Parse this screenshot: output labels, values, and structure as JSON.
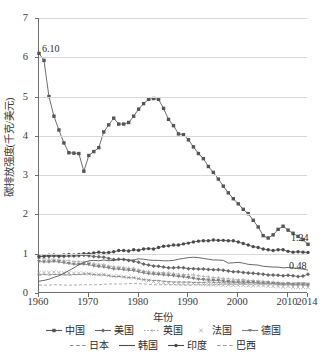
{
  "chart_data": {
    "type": "line",
    "title": "",
    "xlabel": "年份",
    "ylabel": "碳排放强度(千克/美元)",
    "xlim": [
      1960,
      2014
    ],
    "ylim": [
      0,
      7
    ],
    "yticks": [
      0,
      1,
      2,
      3,
      4,
      5,
      6,
      7
    ],
    "xticks": [
      1960,
      1970,
      1980,
      1990,
      2000,
      2010,
      2014
    ],
    "grid": true,
    "legend_position": "bottom",
    "annotations": [
      {
        "text": "6.10",
        "x": 1960,
        "y": 6.1
      },
      {
        "text": "1.24",
        "x": 2014,
        "y": 1.24
      },
      {
        "text": "0.48",
        "x": 2014,
        "y": 0.48
      }
    ],
    "x": [
      1960,
      1961,
      1962,
      1963,
      1964,
      1965,
      1966,
      1967,
      1968,
      1969,
      1970,
      1971,
      1972,
      1973,
      1974,
      1975,
      1976,
      1977,
      1978,
      1979,
      1980,
      1981,
      1982,
      1983,
      1984,
      1985,
      1986,
      1987,
      1988,
      1989,
      1990,
      1991,
      1992,
      1993,
      1994,
      1995,
      1996,
      1997,
      1998,
      1999,
      2000,
      2001,
      2002,
      2003,
      2004,
      2005,
      2006,
      2007,
      2008,
      2009,
      2010,
      2011,
      2012,
      2013,
      2014
    ],
    "series": [
      {
        "name": "中国",
        "marker": "square",
        "linestyle": "solid",
        "color": "#555555",
        "values": [
          6.1,
          5.92,
          5.0,
          4.5,
          4.15,
          3.82,
          3.57,
          3.56,
          3.55,
          3.1,
          3.5,
          3.6,
          3.7,
          4.1,
          4.28,
          4.45,
          4.3,
          4.3,
          4.34,
          4.5,
          4.68,
          4.82,
          4.93,
          4.95,
          4.93,
          4.7,
          4.42,
          4.26,
          4.05,
          4.03,
          3.9,
          3.72,
          3.55,
          3.42,
          3.22,
          3.07,
          2.9,
          2.72,
          2.55,
          2.4,
          2.27,
          2.13,
          2.02,
          1.85,
          1.68,
          1.46,
          1.4,
          1.48,
          1.62,
          1.7,
          1.6,
          1.52,
          1.44,
          1.36,
          1.24
        ]
      },
      {
        "name": "美国",
        "marker": "diamond",
        "linestyle": "solid",
        "color": "#666666",
        "values": [
          0.94,
          0.93,
          0.93,
          0.94,
          0.93,
          0.93,
          0.94,
          0.94,
          0.95,
          0.96,
          0.95,
          0.93,
          0.92,
          0.91,
          0.88,
          0.85,
          0.86,
          0.85,
          0.83,
          0.81,
          0.78,
          0.74,
          0.71,
          0.69,
          0.68,
          0.66,
          0.64,
          0.64,
          0.65,
          0.64,
          0.62,
          0.62,
          0.61,
          0.61,
          0.6,
          0.59,
          0.59,
          0.58,
          0.56,
          0.54,
          0.54,
          0.52,
          0.51,
          0.5,
          0.49,
          0.48,
          0.46,
          0.46,
          0.45,
          0.44,
          0.45,
          0.44,
          0.42,
          0.43,
          0.48
        ]
      },
      {
        "name": "英国",
        "marker": "cross-small",
        "linestyle": "dotted",
        "color": "#a8a8a8",
        "values": [
          0.88,
          0.87,
          0.86,
          0.86,
          0.84,
          0.83,
          0.82,
          0.8,
          0.8,
          0.79,
          0.78,
          0.75,
          0.73,
          0.72,
          0.69,
          0.67,
          0.66,
          0.65,
          0.63,
          0.63,
          0.59,
          0.56,
          0.55,
          0.53,
          0.52,
          0.52,
          0.51,
          0.5,
          0.48,
          0.47,
          0.46,
          0.46,
          0.44,
          0.42,
          0.41,
          0.39,
          0.39,
          0.37,
          0.36,
          0.35,
          0.34,
          0.34,
          0.32,
          0.32,
          0.31,
          0.3,
          0.29,
          0.28,
          0.27,
          0.25,
          0.25,
          0.23,
          0.23,
          0.22,
          0.21
        ]
      },
      {
        "name": "法国",
        "marker": "x",
        "linestyle": "none",
        "color": "#9a9a9a",
        "values": [
          0.52,
          0.52,
          0.52,
          0.53,
          0.52,
          0.51,
          0.51,
          0.5,
          0.5,
          0.5,
          0.49,
          0.48,
          0.47,
          0.47,
          0.45,
          0.43,
          0.43,
          0.41,
          0.4,
          0.39,
          0.37,
          0.34,
          0.32,
          0.29,
          0.27,
          0.26,
          0.25,
          0.24,
          0.23,
          0.23,
          0.23,
          0.24,
          0.23,
          0.22,
          0.21,
          0.21,
          0.21,
          0.2,
          0.21,
          0.2,
          0.2,
          0.2,
          0.19,
          0.19,
          0.19,
          0.19,
          0.18,
          0.17,
          0.17,
          0.16,
          0.17,
          0.15,
          0.15,
          0.15,
          0.14
        ]
      },
      {
        "name": "德国",
        "marker": "triangle-down",
        "linestyle": "solid",
        "color": "#808080",
        "values": [
          0.8,
          0.79,
          0.79,
          0.8,
          0.79,
          0.77,
          0.75,
          0.73,
          0.73,
          0.73,
          0.72,
          0.69,
          0.67,
          0.66,
          0.64,
          0.61,
          0.61,
          0.59,
          0.58,
          0.57,
          0.54,
          0.51,
          0.49,
          0.48,
          0.47,
          0.46,
          0.45,
          0.44,
          0.42,
          0.41,
          0.39,
          0.37,
          0.35,
          0.34,
          0.33,
          0.32,
          0.32,
          0.3,
          0.29,
          0.28,
          0.28,
          0.28,
          0.27,
          0.27,
          0.26,
          0.25,
          0.25,
          0.24,
          0.23,
          0.22,
          0.23,
          0.21,
          0.21,
          0.21,
          0.2
        ]
      },
      {
        "name": "日本",
        "marker": "dash",
        "linestyle": "dashed",
        "color": "#8d8d8d",
        "values": [
          0.46,
          0.47,
          0.46,
          0.47,
          0.47,
          0.46,
          0.46,
          0.47,
          0.47,
          0.48,
          0.49,
          0.47,
          0.46,
          0.46,
          0.44,
          0.42,
          0.42,
          0.41,
          0.39,
          0.39,
          0.36,
          0.34,
          0.33,
          0.32,
          0.32,
          0.3,
          0.29,
          0.28,
          0.28,
          0.28,
          0.28,
          0.27,
          0.27,
          0.27,
          0.28,
          0.27,
          0.27,
          0.26,
          0.26,
          0.26,
          0.26,
          0.25,
          0.26,
          0.26,
          0.25,
          0.25,
          0.24,
          0.25,
          0.24,
          0.23,
          0.24,
          0.25,
          0.26,
          0.26,
          0.25
        ]
      },
      {
        "name": "韩国",
        "marker": "none",
        "linestyle": "solid",
        "color": "#4d4d4d",
        "values": [
          0.3,
          0.32,
          0.35,
          0.4,
          0.44,
          0.5,
          0.57,
          0.64,
          0.72,
          0.78,
          0.82,
          0.83,
          0.82,
          0.84,
          0.82,
          0.83,
          0.85,
          0.86,
          0.84,
          0.84,
          0.87,
          0.86,
          0.84,
          0.83,
          0.83,
          0.82,
          0.82,
          0.83,
          0.86,
          0.88,
          0.9,
          0.91,
          0.9,
          0.88,
          0.86,
          0.84,
          0.84,
          0.83,
          0.76,
          0.77,
          0.78,
          0.76,
          0.73,
          0.72,
          0.71,
          0.68,
          0.67,
          0.66,
          0.66,
          0.64,
          0.65,
          0.64,
          0.62,
          0.61,
          0.58
        ]
      },
      {
        "name": "印度",
        "marker": "circle",
        "linestyle": "solid",
        "color": "#4a4a4a",
        "values": [
          0.92,
          0.94,
          0.96,
          0.97,
          0.95,
          0.97,
          0.98,
          0.97,
          0.98,
          1.0,
          1.0,
          1.02,
          1.04,
          1.02,
          1.03,
          1.05,
          1.08,
          1.08,
          1.07,
          1.1,
          1.09,
          1.12,
          1.13,
          1.12,
          1.16,
          1.19,
          1.2,
          1.22,
          1.22,
          1.25,
          1.27,
          1.3,
          1.32,
          1.33,
          1.33,
          1.35,
          1.34,
          1.34,
          1.33,
          1.33,
          1.3,
          1.26,
          1.22,
          1.18,
          1.16,
          1.12,
          1.1,
          1.08,
          1.1,
          1.1,
          1.06,
          1.04,
          1.05,
          1.04,
          1.03
        ]
      },
      {
        "name": "巴西",
        "marker": "none",
        "linestyle": "dashed",
        "color": "#9e9e9e",
        "values": [
          0.2,
          0.2,
          0.2,
          0.21,
          0.21,
          0.2,
          0.2,
          0.2,
          0.21,
          0.21,
          0.21,
          0.21,
          0.21,
          0.22,
          0.23,
          0.23,
          0.23,
          0.23,
          0.24,
          0.24,
          0.24,
          0.23,
          0.22,
          0.21,
          0.21,
          0.21,
          0.21,
          0.21,
          0.21,
          0.21,
          0.2,
          0.21,
          0.21,
          0.21,
          0.21,
          0.21,
          0.22,
          0.22,
          0.22,
          0.22,
          0.22,
          0.22,
          0.22,
          0.21,
          0.21,
          0.21,
          0.21,
          0.21,
          0.21,
          0.2,
          0.21,
          0.21,
          0.22,
          0.23,
          0.23
        ]
      }
    ]
  },
  "legend": {
    "row1": [
      "中国",
      "美国",
      "英国",
      "法国",
      "德国"
    ],
    "row2": [
      "日本",
      "韩国",
      "印度",
      "巴西"
    ]
  }
}
